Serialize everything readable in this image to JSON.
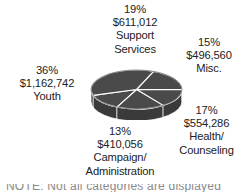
{
  "chart_data": {
    "type": "pie",
    "title": "",
    "subtitle": "",
    "xlabel": "",
    "ylabel": "",
    "style": "3d-pie",
    "legend_position": "none",
    "grid": false,
    "slice_color": "#4a4a4a",
    "slice_side_color": "#3a3a3a",
    "divider_color": "#ffffff",
    "categories": [
      "Support Services",
      "Misc.",
      "Health/ Counseling",
      "Campaign/ Administration",
      "Youth"
    ],
    "values": [
      19,
      15,
      17,
      13,
      36
    ],
    "value_unit": "%",
    "amounts": [
      611012,
      496560,
      554286,
      410056,
      1162742
    ],
    "amounts_formatted": [
      "$611,012",
      "$496,560",
      "$554,286",
      "$410,056",
      "$1,162,742"
    ],
    "slices": [
      {
        "name": "Support Services",
        "percent": "19%",
        "amount": "$611,012",
        "label_lines": [
          "Support",
          "Services"
        ],
        "value": 19,
        "position": "top"
      },
      {
        "name": "Misc.",
        "percent": "15%",
        "amount": "$496,560",
        "label_lines": [
          "Misc."
        ],
        "value": 15,
        "position": "upper-right"
      },
      {
        "name": "Health/Counseling",
        "percent": "17%",
        "amount": "$554,286",
        "label_lines": [
          "Health/",
          "Counseling"
        ],
        "value": 17,
        "position": "lower-right"
      },
      {
        "name": "Campaign/Administration",
        "percent": "13%",
        "amount": "$410,056",
        "label_lines": [
          "Campaign/",
          "Administration"
        ],
        "value": 13,
        "position": "bottom"
      },
      {
        "name": "Youth",
        "percent": "36%",
        "amount": "$1,162,742",
        "label_lines": [
          "Youth"
        ],
        "value": 36,
        "position": "left"
      }
    ]
  },
  "labels": {
    "support": {
      "percent": "19%",
      "amount": "$611,012",
      "line1": "Support",
      "line2": "Services"
    },
    "misc": {
      "percent": "15%",
      "amount": "$496,560",
      "line1": "Misc.",
      "line2": ""
    },
    "health": {
      "percent": "17%",
      "amount": "$554,286",
      "line1": "Health/",
      "line2": "Counseling"
    },
    "campaign": {
      "percent": "13%",
      "amount": "$410,056",
      "line1": "Campaign/",
      "line2": "Administration"
    },
    "youth": {
      "percent": "36%",
      "amount": "$1,162,742",
      "line1": "Youth",
      "line2": ""
    }
  },
  "caption": {
    "cut_off_text": "NOTE: Not all categories are displayed"
  }
}
